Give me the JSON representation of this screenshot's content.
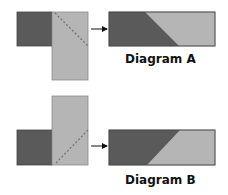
{
  "colors": {
    "dark": "#5a5a5a",
    "light": "#b5b5b5",
    "stroke": "#444444",
    "dash": "#6e6e6e",
    "arrow": "#111111"
  },
  "diagrams": [
    {
      "label": "Diagram A",
      "source": {
        "dark_square": {
          "x": 17,
          "y": 12,
          "w": 35,
          "h": 34
        },
        "light_rect": {
          "x": 52,
          "y": 12,
          "w": 36,
          "h": 68
        },
        "dashed_cut": {
          "x1": 55,
          "y1": 13,
          "x2": 88,
          "y2": 46
        }
      },
      "arrow": {
        "x1": 91,
        "y1": 29,
        "x2": 107,
        "y2": 29
      },
      "result": {
        "rect": {
          "x": 109,
          "y": 12,
          "w": 106,
          "h": 34
        },
        "diagonal_top_x": 145,
        "diagonal_bottom_x": 179
      },
      "label_pos": {
        "x": 125,
        "y": 52
      }
    },
    {
      "label": "Diagram B",
      "source": {
        "dark_square": {
          "x": 17,
          "y": 130,
          "w": 35,
          "h": 35
        },
        "light_rect": {
          "x": 52,
          "y": 96,
          "w": 36,
          "h": 69
        },
        "dashed_cut": {
          "x1": 56,
          "y1": 163,
          "x2": 88,
          "y2": 130
        }
      },
      "arrow": {
        "x1": 91,
        "y1": 146,
        "x2": 107,
        "y2": 146
      },
      "result": {
        "rect": {
          "x": 109,
          "y": 130,
          "w": 106,
          "h": 35
        },
        "diagonal_top_x": 180,
        "diagonal_bottom_x": 147
      },
      "label_pos": {
        "x": 125,
        "y": 173
      }
    }
  ]
}
